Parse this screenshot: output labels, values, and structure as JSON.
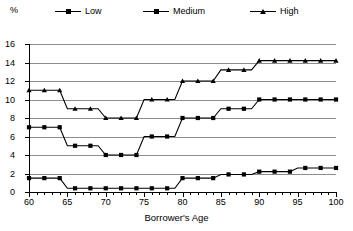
{
  "legend": {
    "unit_label": "%",
    "items": [
      {
        "label": "Low",
        "marker": "square",
        "color": "#000000"
      },
      {
        "label": "Medium",
        "marker": "square",
        "color": "#000000"
      },
      {
        "label": "High",
        "marker": "triangle",
        "color": "#000000"
      }
    ]
  },
  "axes": {
    "x_title": "Borrower's Age",
    "y_title": "%",
    "x_ticks": [
      "60",
      "65",
      "70",
      "75",
      "80",
      "85",
      "90",
      "95",
      "100"
    ],
    "y_ticks": [
      "0",
      "2",
      "4",
      "6",
      "8",
      "10",
      "12",
      "14",
      "16"
    ]
  },
  "chart_data": {
    "type": "line",
    "title": "",
    "subtitle": "",
    "xlabel": "Borrower's Age",
    "ylabel": "%",
    "xlim": [
      60,
      100
    ],
    "ylim": [
      0,
      16
    ],
    "x_tick_step": 5,
    "x_minor_tick_step": 1,
    "y_tick_step": 2,
    "grid": "horizontal",
    "legend_position": "top",
    "x": [
      60,
      61,
      62,
      63,
      64,
      65,
      66,
      67,
      68,
      69,
      70,
      71,
      72,
      73,
      74,
      75,
      76,
      77,
      78,
      79,
      80,
      81,
      82,
      83,
      84,
      85,
      86,
      87,
      88,
      89,
      90,
      91,
      92,
      93,
      94,
      95,
      96,
      97,
      98,
      99,
      100
    ],
    "series": [
      {
        "name": "Low",
        "marker": "square",
        "color": "#000000",
        "values": [
          1.5,
          1.5,
          1.5,
          1.5,
          1.5,
          0.4,
          0.4,
          0.4,
          0.4,
          0.4,
          0.4,
          0.4,
          0.4,
          0.4,
          0.4,
          0.4,
          0.4,
          0.4,
          0.4,
          0.4,
          1.5,
          1.5,
          1.5,
          1.5,
          1.5,
          1.9,
          1.9,
          1.9,
          1.9,
          1.9,
          2.2,
          2.2,
          2.2,
          2.2,
          2.2,
          2.6,
          2.6,
          2.6,
          2.6,
          2.6,
          2.6
        ]
      },
      {
        "name": "Medium",
        "marker": "square",
        "color": "#000000",
        "values": [
          7,
          7,
          7,
          7,
          7,
          5,
          5,
          5,
          5,
          5,
          4,
          4,
          4,
          4,
          4,
          6,
          6,
          6,
          6,
          6,
          8,
          8,
          8,
          8,
          8,
          9,
          9,
          9,
          9,
          9,
          10,
          10,
          10,
          10,
          10,
          10,
          10,
          10,
          10,
          10,
          10
        ]
      },
      {
        "name": "High",
        "marker": "triangle",
        "color": "#000000",
        "values": [
          11,
          11,
          11,
          11,
          11,
          9,
          9,
          9,
          9,
          9,
          8,
          8,
          8,
          8,
          8,
          10,
          10,
          10,
          10,
          10,
          12,
          12,
          12,
          12,
          12,
          13.2,
          13.2,
          13.2,
          13.2,
          13.2,
          14.2,
          14.2,
          14.2,
          14.2,
          14.2,
          14.2,
          14.2,
          14.2,
          14.2,
          14.2,
          14.2
        ]
      }
    ]
  }
}
